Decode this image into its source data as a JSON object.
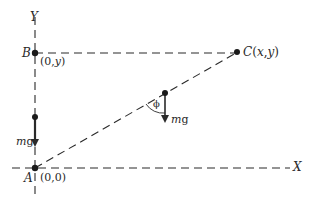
{
  "diagram": {
    "type": "physics-free-body",
    "colors": {
      "ink": "#2a2a2a",
      "background": "#ffffff"
    },
    "axes": {
      "x_label": "X",
      "y_label": "Y"
    },
    "points": {
      "A": {
        "name": "A",
        "coord": "(0,0)"
      },
      "B": {
        "name": "B",
        "coord": "(0,y)"
      },
      "C": {
        "name": "C",
        "coord": "(x,y)"
      }
    },
    "forces": {
      "left_weight": {
        "label_m": "m",
        "label_g": "g"
      },
      "middle_weight": {
        "label_m": "m",
        "label_g": "g"
      }
    },
    "angle": {
      "symbol": "ϕ"
    }
  }
}
